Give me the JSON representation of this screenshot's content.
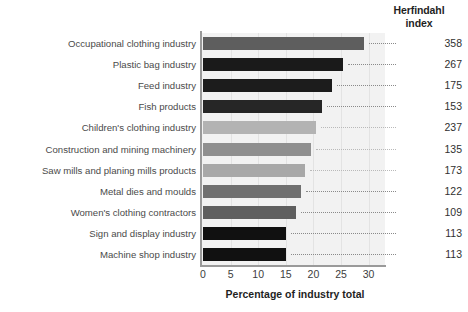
{
  "chart_data": {
    "type": "bar",
    "orientation": "horizontal",
    "title": "",
    "xlabel": "Percentage of industry total",
    "ylabel": "",
    "xlim": [
      0,
      31
    ],
    "xticks": [
      0,
      5,
      10,
      15,
      20,
      25,
      30
    ],
    "grid": true,
    "legend": null,
    "secondary_column_header": "Herfindahl\nindex",
    "secondary_column_header_line1": "Herfindahl",
    "secondary_column_header_line2": "index",
    "categories": [
      "Occupational clothing industry",
      "Plastic bag industry",
      "Feed industry",
      "Fish products",
      "Children's clothing industry",
      "Construction and mining machinery",
      "Saw mills and planing mills products",
      "Metal dies and moulds",
      "Women's clothing contractors",
      "Sign and display industry",
      "Machine shop industry"
    ],
    "values": [
      29.1,
      25.3,
      23.3,
      21.5,
      20.5,
      19.5,
      18.5,
      17.8,
      16.9,
      15.1,
      15.1
    ],
    "herfindahl_index": [
      358,
      267,
      175,
      153,
      237,
      135,
      173,
      122,
      109,
      113,
      113
    ],
    "bar_colors": [
      "#5e5e5e",
      "#1a1a1a",
      "#1c1c1c",
      "#262626",
      "#b3b3b3",
      "#8f8f8f",
      "#a8a8a8",
      "#707070",
      "#5f5f5f",
      "#111111",
      "#111111"
    ],
    "plot_background": "#f2f2f2",
    "axis_color": "#9a9a9a",
    "text_color": "#3c3c3c"
  }
}
